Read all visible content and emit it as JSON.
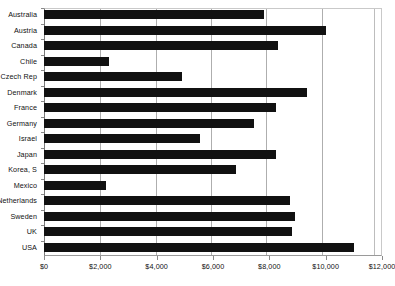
{
  "chart_data": {
    "type": "bar",
    "orientation": "horizontal",
    "title": "",
    "subtitle": "",
    "xlabel": "",
    "ylabel": "",
    "categories": [
      "Australia",
      "Austria",
      "Canada",
      "Chile",
      "Czech Rep",
      "Denmark",
      "France",
      "Germany",
      "Israel",
      "Japan",
      "Korea, S",
      "Mexico",
      "Netherlands",
      "Sweden",
      "UK",
      "USA"
    ],
    "values": [
      7800,
      10000,
      8300,
      2300,
      4900,
      9350,
      8250,
      7450,
      5550,
      8250,
      6800,
      2200,
      8750,
      8900,
      8800,
      11000
    ],
    "xlim": [
      0,
      12000
    ],
    "xticks": [
      0,
      2000,
      4000,
      6000,
      8000,
      10000,
      12000
    ],
    "xtick_labels": [
      "$0",
      "$2,000",
      "$4,000",
      "$6,000",
      "$8,000",
      "$10,000",
      "$12,000"
    ],
    "grid": true,
    "grid_axis": "x",
    "legend": false,
    "legend_position": "none",
    "bar_color": "#111111",
    "grid_color": "#aeaeae",
    "axis_color": "#8a8a8a",
    "background_color": "#ffffff"
  }
}
